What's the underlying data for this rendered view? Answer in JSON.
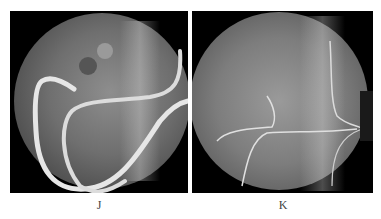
{
  "figure": {
    "panels": [
      {
        "id": "J",
        "label": "J",
        "description": "Fluoroscopic image with looped endoscope/catheter"
      },
      {
        "id": "K",
        "label": "K",
        "description": "Fluoroscopic image with guidewire over spine"
      }
    ]
  }
}
